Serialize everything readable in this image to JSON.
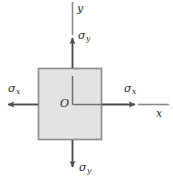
{
  "figure": {
    "colors": {
      "element_fill": "#e3e3e3",
      "element_stroke": "#8c8c8c",
      "arrow": "#4d4d4d",
      "axis": "#7a7a7a",
      "text": "#2b2b2b",
      "background": "#ffffff"
    },
    "labels": {
      "sigma_y_top": {
        "symbol": "σ",
        "subscript": "y"
      },
      "sigma_y_bottom": {
        "symbol": "σ",
        "subscript": "y"
      },
      "sigma_x_left": {
        "symbol": "σ",
        "subscript": "x"
      },
      "sigma_x_right": {
        "symbol": "σ",
        "subscript": "x"
      },
      "axis_y": "y",
      "axis_x": "x",
      "origin": "O"
    },
    "element": {
      "shape": "square",
      "left": 38,
      "top": 68,
      "width": 64,
      "height": 72
    },
    "arrows": [
      {
        "name": "sigma-y-up",
        "direction": "up",
        "from": [
          72,
          68
        ],
        "to": [
          72,
          35
        ]
      },
      {
        "name": "sigma-y-down",
        "direction": "down",
        "from": [
          72,
          140
        ],
        "to": [
          72,
          170
        ]
      },
      {
        "name": "sigma-x-left",
        "direction": "left",
        "from": [
          38,
          104
        ],
        "to": [
          5,
          104
        ]
      },
      {
        "name": "sigma-x-right",
        "direction": "right",
        "from": [
          102,
          104
        ],
        "to": [
          138,
          104
        ]
      }
    ],
    "axes": {
      "y_axis": {
        "from": [
          72,
          2
        ],
        "to": [
          72,
          68
        ]
      },
      "x_axis": {
        "from": [
          102,
          104
        ],
        "to": [
          169,
          104
        ]
      },
      "origin_point": [
        72,
        104
      ],
      "internal_y": {
        "from": [
          72,
          76
        ],
        "to": [
          72,
          104
        ]
      },
      "internal_x": {
        "from": [
          72,
          104
        ],
        "to": [
          102,
          104
        ]
      }
    }
  }
}
